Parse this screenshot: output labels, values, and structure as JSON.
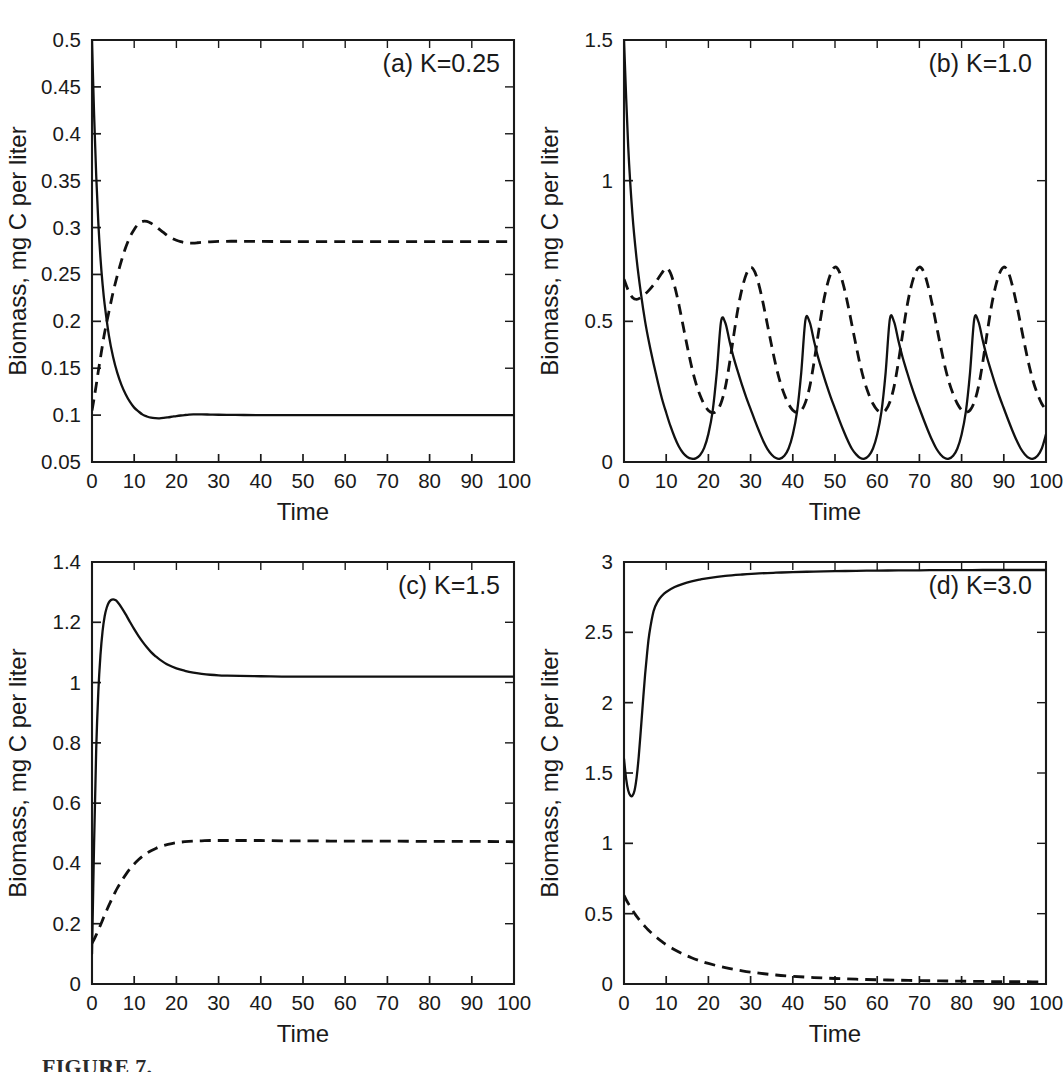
{
  "figure": {
    "caption_partial": "FIGURE 7.",
    "shared_ylabel": "Biomass, mg C per liter",
    "shared_xlabel": "Time",
    "line_styles": {
      "solid": "solid",
      "dashed": "dashed"
    },
    "colors": {
      "ink": "#111111",
      "background": "#ffffff"
    }
  },
  "chart_data": [
    {
      "type": "line",
      "panel_id": "a",
      "title": "(a) K=0.25",
      "xlabel": "Time",
      "ylabel": "Biomass, mg C per liter",
      "xlim": [
        0,
        100
      ],
      "ylim": [
        0.05,
        0.5
      ],
      "xticks": [
        0,
        10,
        20,
        30,
        40,
        50,
        60,
        70,
        80,
        90,
        100
      ],
      "yticks": [
        0.05,
        0.1,
        0.15,
        0.2,
        0.25,
        0.3,
        0.35,
        0.4,
        0.45,
        0.5
      ],
      "xticklabels": [
        "0",
        "10",
        "20",
        "30",
        "40",
        "50",
        "60",
        "70",
        "80",
        "90",
        "100"
      ],
      "yticklabels": [
        "0.05",
        "0.1",
        "0.15",
        "0.2",
        "0.25",
        "0.3",
        "0.35",
        "0.4",
        "0.45",
        "0.5"
      ],
      "grid": false,
      "legend": "none",
      "x": [
        0,
        0.5,
        1,
        1.5,
        2,
        2.5,
        3,
        4,
        5,
        6,
        7,
        8,
        9,
        10,
        11,
        12,
        13,
        14,
        15,
        16,
        17,
        18,
        19,
        20,
        21,
        22,
        23,
        24,
        25,
        26,
        28,
        30,
        33,
        36,
        40,
        45,
        50,
        60,
        70,
        80,
        90,
        100
      ],
      "series": [
        {
          "name": "solid",
          "style": "solid",
          "values": [
            0.5,
            0.42,
            0.355,
            0.305,
            0.268,
            0.24,
            0.218,
            0.185,
            0.162,
            0.145,
            0.132,
            0.122,
            0.114,
            0.108,
            0.104,
            0.1005,
            0.0985,
            0.0972,
            0.0967,
            0.0966,
            0.097,
            0.0976,
            0.0983,
            0.099,
            0.0996,
            0.1001,
            0.1005,
            0.1007,
            0.1008,
            0.1008,
            0.1006,
            0.1004,
            0.1002,
            0.1001,
            0.1,
            0.1,
            0.1,
            0.1,
            0.1,
            0.1,
            0.1,
            0.1
          ]
        },
        {
          "name": "dashed",
          "style": "dashed",
          "values": [
            0.105,
            0.118,
            0.132,
            0.147,
            0.161,
            0.175,
            0.188,
            0.21,
            0.231,
            0.249,
            0.265,
            0.279,
            0.29,
            0.298,
            0.304,
            0.3065,
            0.3065,
            0.3045,
            0.3015,
            0.298,
            0.2945,
            0.291,
            0.2885,
            0.2865,
            0.285,
            0.284,
            0.2835,
            0.2835,
            0.2838,
            0.2842,
            0.2848,
            0.2852,
            0.2854,
            0.2853,
            0.2852,
            0.2851,
            0.285,
            0.285,
            0.285,
            0.285,
            0.285,
            0.285
          ]
        }
      ]
    },
    {
      "type": "line",
      "panel_id": "b",
      "title": "(b) K=1.0",
      "xlabel": "Time",
      "ylabel": "Biomass, mg C per liter",
      "xlim": [
        0,
        100
      ],
      "ylim": [
        0,
        1.5
      ],
      "xticks": [
        0,
        10,
        20,
        30,
        40,
        50,
        60,
        70,
        80,
        90,
        100
      ],
      "yticks": [
        0,
        0.5,
        1,
        1.5
      ],
      "xticklabels": [
        "0",
        "10",
        "20",
        "30",
        "40",
        "50",
        "60",
        "70",
        "80",
        "90",
        "100"
      ],
      "yticklabels": [
        "0",
        "0.5",
        "1",
        "1.5"
      ],
      "grid": false,
      "legend": "none",
      "oscillation": {
        "period": 20,
        "solid_peak": 0.51,
        "solid_trough": 0.01,
        "dashed_peak": 0.69,
        "dashed_trough": 0.17
      },
      "x": [
        0,
        1,
        2,
        3,
        4,
        5,
        6,
        7,
        8,
        9,
        10,
        11,
        12,
        13,
        14,
        15,
        16,
        17,
        18,
        19,
        20,
        21,
        22,
        23,
        24,
        25,
        26,
        27,
        28,
        29,
        30,
        31,
        32,
        33,
        34,
        35,
        36,
        37,
        38,
        39,
        40,
        41,
        42,
        43,
        44,
        45,
        46,
        47,
        48,
        49,
        50,
        51,
        52,
        53,
        54,
        55,
        56,
        57,
        58,
        59,
        60,
        61,
        62,
        63,
        64,
        65,
        66,
        67,
        68,
        69,
        70,
        71,
        72,
        73,
        74,
        75,
        76,
        77,
        78,
        79,
        80,
        81,
        82,
        83,
        84,
        85,
        86,
        87,
        88,
        89,
        90,
        91,
        92,
        93,
        94,
        95,
        96,
        97,
        98,
        99,
        100
      ],
      "series": [
        {
          "name": "solid",
          "style": "solid",
          "values": [
            1.5,
            1.12,
            0.88,
            0.72,
            0.6,
            0.5,
            0.42,
            0.35,
            0.285,
            0.225,
            0.175,
            0.128,
            0.088,
            0.055,
            0.032,
            0.018,
            0.012,
            0.013,
            0.024,
            0.05,
            0.1,
            0.18,
            0.32,
            0.5,
            0.495,
            0.43,
            0.37,
            0.32,
            0.272,
            0.228,
            0.188,
            0.148,
            0.11,
            0.075,
            0.046,
            0.026,
            0.014,
            0.012,
            0.022,
            0.048,
            0.098,
            0.178,
            0.318,
            0.505,
            0.497,
            0.432,
            0.372,
            0.322,
            0.274,
            0.23,
            0.19,
            0.15,
            0.112,
            0.077,
            0.047,
            0.027,
            0.014,
            0.012,
            0.022,
            0.048,
            0.098,
            0.178,
            0.318,
            0.508,
            0.498,
            0.433,
            0.373,
            0.323,
            0.275,
            0.231,
            0.191,
            0.151,
            0.113,
            0.078,
            0.048,
            0.027,
            0.014,
            0.012,
            0.022,
            0.048,
            0.098,
            0.178,
            0.318,
            0.508,
            0.498,
            0.433,
            0.373,
            0.323,
            0.275,
            0.231,
            0.191,
            0.151,
            0.113,
            0.078,
            0.048,
            0.027,
            0.014,
            0.012,
            0.022,
            0.048,
            0.098
          ]
        },
        {
          "name": "dashed",
          "style": "dashed",
          "values": [
            0.65,
            0.61,
            0.585,
            0.578,
            0.585,
            0.597,
            0.612,
            0.63,
            0.65,
            0.672,
            0.69,
            0.672,
            0.625,
            0.56,
            0.485,
            0.41,
            0.34,
            0.282,
            0.238,
            0.205,
            0.183,
            0.175,
            0.182,
            0.21,
            0.265,
            0.35,
            0.45,
            0.545,
            0.618,
            0.668,
            0.692,
            0.676,
            0.628,
            0.562,
            0.487,
            0.412,
            0.342,
            0.284,
            0.24,
            0.206,
            0.184,
            0.176,
            0.183,
            0.212,
            0.267,
            0.352,
            0.452,
            0.547,
            0.62,
            0.67,
            0.693,
            0.677,
            0.629,
            0.563,
            0.488,
            0.413,
            0.343,
            0.285,
            0.241,
            0.207,
            0.185,
            0.177,
            0.184,
            0.213,
            0.268,
            0.353,
            0.453,
            0.548,
            0.621,
            0.671,
            0.693,
            0.677,
            0.629,
            0.563,
            0.488,
            0.413,
            0.343,
            0.285,
            0.241,
            0.207,
            0.185,
            0.177,
            0.184,
            0.213,
            0.268,
            0.353,
            0.453,
            0.548,
            0.621,
            0.671,
            0.693,
            0.677,
            0.629,
            0.563,
            0.488,
            0.413,
            0.343,
            0.285,
            0.241,
            0.207,
            0.185
          ]
        }
      ]
    },
    {
      "type": "line",
      "panel_id": "c",
      "title": "(c) K=1.5",
      "xlabel": "Time",
      "ylabel": "Biomass, mg C per liter",
      "xlim": [
        0,
        100
      ],
      "ylim": [
        0,
        1.4
      ],
      "xticks": [
        0,
        10,
        20,
        30,
        40,
        50,
        60,
        70,
        80,
        90,
        100
      ],
      "yticks": [
        0,
        0.2,
        0.4,
        0.6,
        0.8,
        1,
        1.2,
        1.4
      ],
      "xticklabels": [
        "0",
        "10",
        "20",
        "30",
        "40",
        "50",
        "60",
        "70",
        "80",
        "90",
        "100"
      ],
      "yticklabels": [
        "0",
        "0.2",
        "0.4",
        "0.6",
        "0.8",
        "1",
        "1.2",
        "1.4"
      ],
      "grid": false,
      "legend": "none",
      "x": [
        0,
        0.5,
        1,
        1.5,
        2,
        2.5,
        3,
        3.5,
        4,
        4.5,
        5,
        5.5,
        6,
        7,
        8,
        9,
        10,
        11,
        12,
        13,
        14,
        15,
        16,
        18,
        20,
        22,
        24,
        26,
        28,
        30,
        32,
        35,
        40,
        45,
        50,
        60,
        70,
        80,
        90,
        100
      ],
      "series": [
        {
          "name": "solid",
          "style": "solid",
          "values": [
            0.1,
            0.47,
            0.78,
            0.97,
            1.09,
            1.17,
            1.22,
            1.249,
            1.266,
            1.274,
            1.276,
            1.274,
            1.268,
            1.249,
            1.226,
            1.201,
            1.177,
            1.155,
            1.135,
            1.117,
            1.101,
            1.088,
            1.077,
            1.059,
            1.047,
            1.039,
            1.033,
            1.029,
            1.026,
            1.024,
            1.023,
            1.022,
            1.021,
            1.02,
            1.02,
            1.02,
            1.02,
            1.02,
            1.02,
            1.02
          ]
        },
        {
          "name": "dashed",
          "style": "dashed",
          "values": [
            0.135,
            0.148,
            0.163,
            0.179,
            0.195,
            0.212,
            0.229,
            0.245,
            0.261,
            0.276,
            0.291,
            0.305,
            0.318,
            0.342,
            0.363,
            0.382,
            0.398,
            0.412,
            0.424,
            0.434,
            0.442,
            0.449,
            0.455,
            0.463,
            0.469,
            0.472,
            0.474,
            0.475,
            0.476,
            0.476,
            0.476,
            0.476,
            0.476,
            0.475,
            0.475,
            0.474,
            0.474,
            0.473,
            0.473,
            0.472
          ]
        }
      ]
    },
    {
      "type": "line",
      "panel_id": "d",
      "title": "(d) K=3.0",
      "xlabel": "Time",
      "ylabel": "Biomass, mg C per liter",
      "xlim": [
        0,
        100
      ],
      "ylim": [
        0,
        3
      ],
      "xticks": [
        0,
        10,
        20,
        30,
        40,
        50,
        60,
        70,
        80,
        90,
        100
      ],
      "yticks": [
        0,
        0.5,
        1,
        1.5,
        2,
        2.5,
        3
      ],
      "xticklabels": [
        "0",
        "10",
        "20",
        "30",
        "40",
        "50",
        "60",
        "70",
        "80",
        "90",
        "100"
      ],
      "yticklabels": [
        "0",
        "0.5",
        "1",
        "1.5",
        "2",
        "2.5",
        "3"
      ],
      "grid": false,
      "legend": "none",
      "x": [
        0,
        0.5,
        1,
        1.5,
        2,
        2.5,
        3,
        3.5,
        4,
        4.5,
        5,
        5.5,
        6,
        7,
        8,
        9,
        10,
        12,
        14,
        16,
        18,
        20,
        24,
        28,
        32,
        36,
        40,
        45,
        50,
        55,
        60,
        65,
        70,
        75,
        80,
        85,
        90,
        95,
        100
      ],
      "series": [
        {
          "name": "solid",
          "style": "solid",
          "values": [
            1.6,
            1.46,
            1.375,
            1.34,
            1.338,
            1.375,
            1.47,
            1.62,
            1.81,
            2.01,
            2.2,
            2.36,
            2.49,
            2.65,
            2.72,
            2.76,
            2.787,
            2.822,
            2.845,
            2.862,
            2.875,
            2.886,
            2.901,
            2.911,
            2.919,
            2.924,
            2.928,
            2.932,
            2.935,
            2.937,
            2.939,
            2.94,
            2.941,
            2.942,
            2.942,
            2.943,
            2.943,
            2.943,
            2.943
          ]
        },
        {
          "name": "dashed",
          "style": "dashed",
          "values": [
            0.63,
            0.6,
            0.573,
            0.548,
            0.524,
            0.502,
            0.481,
            0.461,
            0.443,
            0.425,
            0.408,
            0.392,
            0.377,
            0.349,
            0.324,
            0.301,
            0.28,
            0.244,
            0.213,
            0.187,
            0.165,
            0.146,
            0.116,
            0.094,
            0.077,
            0.064,
            0.055,
            0.046,
            0.039,
            0.034,
            0.03,
            0.027,
            0.024,
            0.022,
            0.02,
            0.018,
            0.017,
            0.016,
            0.015
          ]
        }
      ]
    }
  ]
}
